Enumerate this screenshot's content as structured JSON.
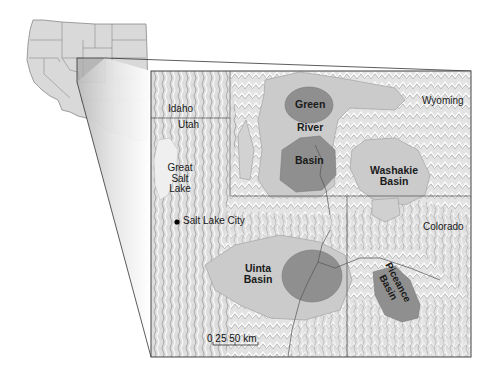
{
  "figure": {
    "type": "locator map with inset",
    "inset": {
      "description": "Outline map of the western United States with state boundaries",
      "highlight_box_label": ""
    },
    "main_map": {
      "state_labels": [
        {
          "id": "idaho",
          "text": "Idaho"
        },
        {
          "id": "utah",
          "text": "Utah"
        },
        {
          "id": "wyoming",
          "text": "Wyoming"
        },
        {
          "id": "colorado",
          "text": "Colorado"
        }
      ],
      "water_labels": [
        {
          "id": "great-salt-lake",
          "lines": [
            "Great",
            "Salt",
            "Lake"
          ]
        }
      ],
      "city_labels": [
        {
          "id": "salt-lake-city",
          "text": "Salt Lake City",
          "symbol": "filled-circle"
        }
      ],
      "basin_labels": [
        {
          "id": "green-river-basin",
          "lines": [
            "Green",
            "River",
            "Basin"
          ]
        },
        {
          "id": "washakie-basin",
          "lines": [
            "Washakie",
            "Basin"
          ]
        },
        {
          "id": "uinta-basin",
          "lines": [
            "Uinta",
            "Basin"
          ]
        },
        {
          "id": "piceance-basin",
          "lines": [
            "Piceance",
            "Basin"
          ]
        }
      ],
      "scale_bar": {
        "ticks": [
          "0",
          "25",
          "50"
        ],
        "unit": "km",
        "text": "0  25  50 km"
      }
    },
    "colors": {
      "basin_outer": "#c9c9c9",
      "basin_core": "#8e8e8e",
      "terrain": "#e4e4e4",
      "boundary": "#555555",
      "inset_land": "#d8d8d8",
      "inset_highlight": "#a8a8a8"
    }
  }
}
